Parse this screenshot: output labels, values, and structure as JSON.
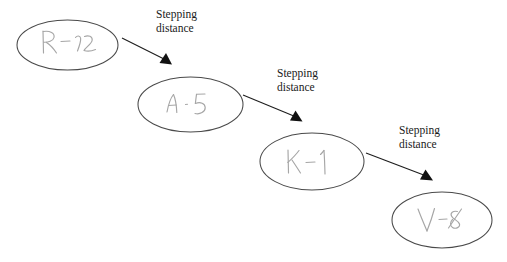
{
  "diagram": {
    "type": "flow-chain",
    "background_color": "#ffffff",
    "node_stroke_color": "#4a4a4a",
    "handwriting_color": "#a9a9a9",
    "edge_color": "#1d1d1d",
    "label_color": "#1a1a1a",
    "nodes": [
      {
        "id": "node-1",
        "label": "R -12",
        "style": "handwritten",
        "shape": "ellipse",
        "cx": 67.5,
        "cy": 45,
        "rx": 50.5,
        "ry": 25
      },
      {
        "id": "node-2",
        "label": "A - 5",
        "style": "handwritten",
        "shape": "ellipse",
        "cx": 190.5,
        "cy": 104.5,
        "rx": 52.5,
        "ry": 27.5
      },
      {
        "id": "node-3",
        "label": "K - 1",
        "style": "handwritten",
        "shape": "ellipse",
        "cx": 312,
        "cy": 161.5,
        "rx": 52,
        "ry": 28.5
      },
      {
        "id": "node-4",
        "label": "V - 8",
        "style": "handwritten",
        "shape": "ellipse",
        "cx": 442,
        "cy": 220,
        "rx": 50,
        "ry": 28
      }
    ],
    "edges": [
      {
        "id": "edge-1",
        "from": "node-1",
        "to": "node-2",
        "label": "Stepping\ndistance",
        "label_x": 156,
        "label_y": 8,
        "x1": 122,
        "y1": 38,
        "x2": 167,
        "y2": 61
      },
      {
        "id": "edge-2",
        "from": "node-2",
        "to": "node-3",
        "label": "Stepping\ndistance",
        "label_x": 277,
        "label_y": 67,
        "x1": 243,
        "y1": 95,
        "x2": 299,
        "y2": 118
      },
      {
        "id": "edge-3",
        "from": "node-3",
        "to": "node-4",
        "label": "Stepping\ndistance",
        "label_x": 399,
        "label_y": 124,
        "x1": 366,
        "y1": 153,
        "x2": 429,
        "y2": 177
      }
    ]
  }
}
